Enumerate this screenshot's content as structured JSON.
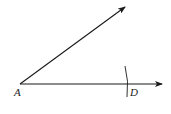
{
  "diagram": {
    "type": "geometry-construction",
    "points": {
      "A": {
        "label": "A",
        "x": 20,
        "y": 84
      },
      "D": {
        "label": "D",
        "x": 127,
        "y": 84
      }
    },
    "rays": [
      {
        "name": "upper-ray",
        "from": "A",
        "to": [
          125,
          7
        ]
      },
      {
        "name": "horizontal-ray",
        "from": "A",
        "to": [
          162,
          84
        ]
      }
    ],
    "arc": {
      "center": "A",
      "crosses_at": "D",
      "y_from": 66,
      "y_to": 97
    },
    "colors": {
      "stroke": "#1a1a1a",
      "background": "#ffffff"
    }
  }
}
